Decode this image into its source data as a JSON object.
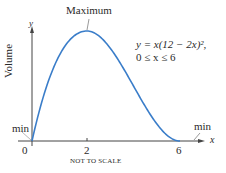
{
  "chart_data": {
    "type": "line",
    "title": "",
    "function": "y = x(12 - 2x)^2",
    "domain_text": "0 ≤ x ≤ 6",
    "xlabel": "x",
    "ylabel": "Volume",
    "y_axis_symbol": "y",
    "x_ticks": [
      "0",
      "2",
      "6"
    ],
    "x": [
      0,
      1,
      2,
      3,
      4,
      5,
      6
    ],
    "values": [
      0,
      100,
      128,
      108,
      64,
      20,
      0
    ],
    "xlim": [
      0,
      6
    ],
    "annotations": [
      "Maximum",
      "min",
      "min",
      "NOT TO SCALE"
    ],
    "grid": false,
    "legend": "none",
    "curve_color": "#3a7dc9"
  },
  "labels": {
    "maximum": "Maximum",
    "equation_line1": "y = x(12 − 2x)²,",
    "equation_line2": "0 ≤ x ≤ 6",
    "y_axis_title": "Volume",
    "y_symbol": "y",
    "x_symbol": "x",
    "tick_0": "0",
    "tick_2": "2",
    "tick_6": "6",
    "min_left": "min",
    "min_right": "min",
    "not_to_scale": "NOT TO SCALE"
  }
}
